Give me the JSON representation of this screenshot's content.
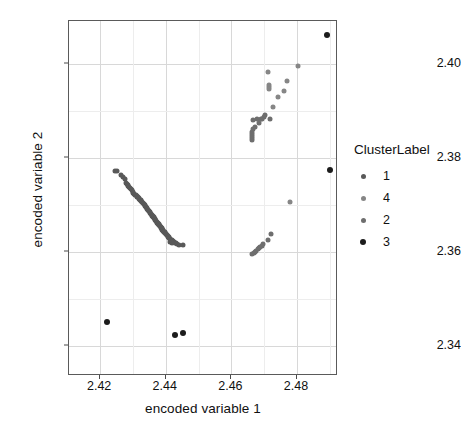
{
  "chart_data": {
    "type": "scatter",
    "title": "",
    "xlabel": "encoded variable 1",
    "ylabel": "encoded variable 2",
    "xlim": [
      2.4105,
      2.4925
    ],
    "ylim": [
      2.3335,
      2.4092
    ],
    "xticks": [
      "2.42",
      "2.44",
      "2.46",
      "2.48"
    ],
    "xtick_values": [
      2.42,
      2.44,
      2.46,
      2.48
    ],
    "yticks": [
      "2.34",
      "2.36",
      "2.38",
      "2.40"
    ],
    "ytick_values": [
      2.34,
      2.36,
      2.38,
      2.4
    ],
    "grid": true,
    "legend_position": "right",
    "legend_title": "ClusterLabel",
    "point_size": 5,
    "series": [
      {
        "name": "1",
        "color": "#595959",
        "values": [
          [
            2.4246,
            2.3773
          ],
          [
            2.4252,
            2.3772
          ],
          [
            2.4263,
            2.3763
          ],
          [
            2.4271,
            2.3759
          ],
          [
            2.4276,
            2.3756
          ],
          [
            2.428,
            2.3747
          ],
          [
            2.4283,
            2.3744
          ],
          [
            2.4284,
            2.3742
          ],
          [
            2.4286,
            2.374
          ],
          [
            2.4289,
            2.3737
          ],
          [
            2.4291,
            2.3735
          ],
          [
            2.4294,
            2.3733
          ],
          [
            2.4296,
            2.3731
          ],
          [
            2.4299,
            2.3728
          ],
          [
            2.4301,
            2.3726
          ],
          [
            2.4304,
            2.3724
          ],
          [
            2.4306,
            2.3722
          ],
          [
            2.4308,
            2.3721
          ],
          [
            2.4311,
            2.3719
          ],
          [
            2.4313,
            2.3717
          ],
          [
            2.4315,
            2.3716
          ],
          [
            2.4317,
            2.3714
          ],
          [
            2.4319,
            2.3713
          ],
          [
            2.4321,
            2.3711
          ],
          [
            2.4323,
            2.371
          ],
          [
            2.4325,
            2.3708
          ],
          [
            2.4327,
            2.3707
          ],
          [
            2.4329,
            2.3705
          ],
          [
            2.4331,
            2.3704
          ],
          [
            2.4333,
            2.3702
          ],
          [
            2.4335,
            2.3701
          ],
          [
            2.4336,
            2.3699
          ],
          [
            2.4338,
            2.3698
          ],
          [
            2.434,
            2.3696
          ],
          [
            2.4341,
            2.3695
          ],
          [
            2.4343,
            2.3693
          ],
          [
            2.4344,
            2.3692
          ],
          [
            2.4346,
            2.369
          ],
          [
            2.4347,
            2.3689
          ],
          [
            2.4349,
            2.3687
          ],
          [
            2.435,
            2.3686
          ],
          [
            2.4352,
            2.3684
          ],
          [
            2.4353,
            2.3683
          ],
          [
            2.4355,
            2.3681
          ],
          [
            2.4356,
            2.368
          ],
          [
            2.4358,
            2.3678
          ],
          [
            2.4359,
            2.3677
          ],
          [
            2.436,
            2.3676
          ],
          [
            2.4362,
            2.3674
          ],
          [
            2.4363,
            2.3673
          ],
          [
            2.4364,
            2.3672
          ],
          [
            2.4366,
            2.367
          ],
          [
            2.4367,
            2.3669
          ],
          [
            2.4368,
            2.3668
          ],
          [
            2.437,
            2.3666
          ],
          [
            2.4371,
            2.3665
          ],
          [
            2.4372,
            2.3664
          ],
          [
            2.4374,
            2.3662
          ],
          [
            2.4375,
            2.3661
          ],
          [
            2.4376,
            2.366
          ],
          [
            2.4378,
            2.3659
          ],
          [
            2.4379,
            2.3657
          ],
          [
            2.438,
            2.3656
          ],
          [
            2.4382,
            2.3655
          ],
          [
            2.4383,
            2.3654
          ],
          [
            2.4384,
            2.3652
          ],
          [
            2.4386,
            2.3651
          ],
          [
            2.4387,
            2.365
          ],
          [
            2.4388,
            2.3649
          ],
          [
            2.439,
            2.3647
          ],
          [
            2.4391,
            2.3646
          ],
          [
            2.4393,
            2.3645
          ],
          [
            2.4394,
            2.3643
          ],
          [
            2.4396,
            2.3642
          ],
          [
            2.4397,
            2.3641
          ],
          [
            2.4398,
            2.364
          ],
          [
            2.44,
            2.3638
          ],
          [
            2.4401,
            2.3637
          ],
          [
            2.4403,
            2.3636
          ],
          [
            2.4404,
            2.3635
          ],
          [
            2.4406,
            2.3633
          ],
          [
            2.4408,
            2.3632
          ],
          [
            2.4409,
            2.3631
          ],
          [
            2.4411,
            2.363
          ],
          [
            2.4413,
            2.3628
          ],
          [
            2.4414,
            2.3627
          ],
          [
            2.4416,
            2.3626
          ],
          [
            2.4418,
            2.3625
          ],
          [
            2.442,
            2.3623
          ],
          [
            2.4422,
            2.3622
          ],
          [
            2.4424,
            2.3621
          ],
          [
            2.4426,
            2.362
          ],
          [
            2.4428,
            2.3619
          ],
          [
            2.443,
            2.3618
          ],
          [
            2.4433,
            2.3617
          ],
          [
            2.4412,
            2.3621
          ],
          [
            2.442,
            2.3619
          ],
          [
            2.444,
            2.3615
          ],
          [
            2.4452,
            2.3614
          ]
        ]
      },
      {
        "name": "4",
        "color": "#868686",
        "values": [
          [
            2.4712,
            2.3983
          ],
          [
            2.4802,
            2.3997
          ],
          [
            2.477,
            2.3963
          ],
          [
            2.4716,
            2.3956
          ],
          [
            2.4715,
            2.3952
          ],
          [
            2.4716,
            2.3948
          ],
          [
            2.476,
            2.3943
          ],
          [
            2.4741,
            2.393
          ],
          [
            2.4779,
            2.3707
          ],
          [
            2.4726,
            2.3908
          ]
        ]
      },
      {
        "name": "2",
        "color": "#6e6e6e",
        "values": [
          [
            2.4702,
            2.3891
          ],
          [
            2.47,
            2.3887
          ],
          [
            2.4678,
            2.3882
          ],
          [
            2.469,
            2.3882
          ],
          [
            2.4694,
            2.3882
          ],
          [
            2.4665,
            2.3881
          ],
          [
            2.4683,
            2.3874
          ],
          [
            2.4671,
            2.3866
          ],
          [
            2.4667,
            2.3861
          ],
          [
            2.4664,
            2.3856
          ],
          [
            2.4664,
            2.3851
          ],
          [
            2.4663,
            2.3846
          ],
          [
            2.4662,
            2.3842
          ],
          [
            2.4663,
            2.3838
          ],
          [
            2.4718,
            2.3884
          ],
          [
            2.4722,
            2.3637
          ],
          [
            2.4712,
            2.3626
          ],
          [
            2.4697,
            2.3616
          ],
          [
            2.4692,
            2.3613
          ],
          [
            2.4688,
            2.361
          ],
          [
            2.4684,
            2.3607
          ],
          [
            2.468,
            2.3605
          ],
          [
            2.4676,
            2.3602
          ],
          [
            2.4672,
            2.36
          ],
          [
            2.4668,
            2.3598
          ],
          [
            2.4664,
            2.3596
          ]
        ]
      },
      {
        "name": "3",
        "color": "#1c1c1c",
        "values": [
          [
            2.4891,
            2.4063
          ],
          [
            2.4902,
            2.3774
          ],
          [
            2.4221,
            2.345
          ],
          [
            2.4428,
            2.3423
          ],
          [
            2.4452,
            2.3426
          ]
        ]
      }
    ]
  },
  "legend": {
    "title": "ClusterLabel",
    "items": [
      {
        "label": "1",
        "color": "#595959"
      },
      {
        "label": "4",
        "color": "#868686"
      },
      {
        "label": "2",
        "color": "#6e6e6e"
      },
      {
        "label": "3",
        "color": "#1c1c1c"
      }
    ]
  },
  "axes": {
    "x_title": "encoded variable 1",
    "y_title": "encoded variable 2"
  },
  "style": {
    "panel_background": "#ffffff",
    "panel_border": "#5a5a5a",
    "grid_major": "#d8d8d8",
    "grid_minor": "#ededed",
    "text_color": "#101010"
  }
}
